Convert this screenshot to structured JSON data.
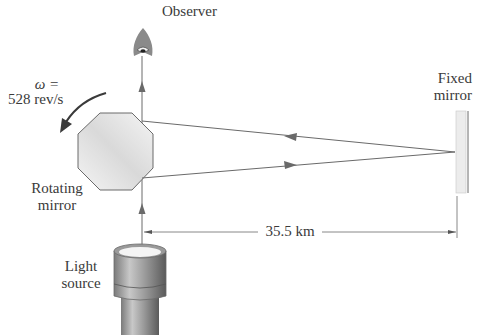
{
  "labels": {
    "observer": "Observer",
    "omega_symbol": "ω =",
    "omega_value": "528 rev/s",
    "rotating_mirror_line1": "Rotating",
    "rotating_mirror_line2": "mirror",
    "fixed_mirror_line1": "Fixed",
    "fixed_mirror_line2": "mirror",
    "distance": "35.5 km",
    "light_source_line1": "Light",
    "light_source_line2": "source"
  },
  "colors": {
    "line": "#6a6a6a",
    "text": "#3a3a3a",
    "mirror_fill": "#e6e6e6"
  }
}
